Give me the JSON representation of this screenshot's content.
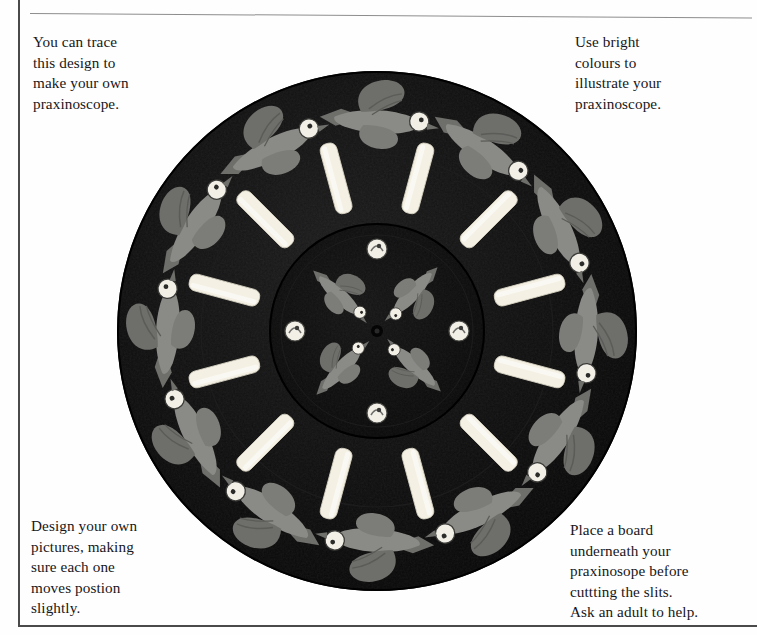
{
  "page": {
    "background_color": "#fefefe",
    "frame_color": "#4a4a4a",
    "rule_color": "#8d8d8d"
  },
  "captions": {
    "top_left": "You can trace\nthis design to\nmake your own\npraxinoscope.",
    "top_right": "Use bright\ncolours to\nillustrate your\npraxinoscope.",
    "bottom_left": "Design your own\npictures, making\nsure each one\nmoves postion\nslightly.",
    "bottom_right": "Place a board\nunderneath your\npraxinosope before\ncuttting the slits.\nAsk an adult to help."
  },
  "illustration": {
    "name": "praxinoscope-disc",
    "description": "Black circular praxinoscope disc with twelve cream viewing slits, an outer ring of twelve grey flying birds and an inner disc of four radiating birds.",
    "disc_color": "#0b0b0b",
    "inner_disc_color": "#111111",
    "slit_color": "#f4f0e4",
    "bird_body_color": "#8a8a86",
    "bird_wing_color": "#6e6e6b",
    "bird_head_color": "#f2efe6",
    "outer_radius_px": 260,
    "inner_radius_px": 108,
    "slit_count": 12,
    "outer_bird_count": 12,
    "inner_bird_count": 4,
    "inner_head_count": 4,
    "center": {
      "x": 267,
      "y": 261
    }
  }
}
